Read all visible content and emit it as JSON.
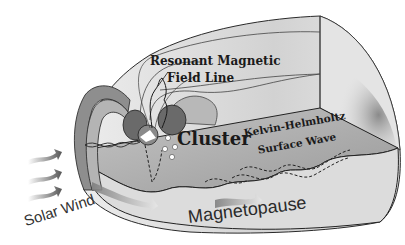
{
  "figure": {
    "labels": {
      "resonant_line1": "Resonant Magnetic",
      "resonant_line2": "Field Line",
      "cluster": "Cluster",
      "kh_line1": "Kelvin-Helmholtz",
      "kh_line2": "Surface Wave",
      "solar_wind": "Solar Wind",
      "magnetopause": "Magnetopause"
    },
    "colors": {
      "background": "#ffffff",
      "outer_shell": "#d9d9d9",
      "inner_wall": "#c8c8c8",
      "floor": "#a8a8a8",
      "earth_lobes": "#6a6a6a",
      "outline": "#1f1f1f",
      "arrows": "#6f6f6f"
    },
    "elements": {
      "solar_wind_arrows": 3,
      "cluster_spacecraft": 4,
      "dashed_wave_lines": 3
    }
  }
}
